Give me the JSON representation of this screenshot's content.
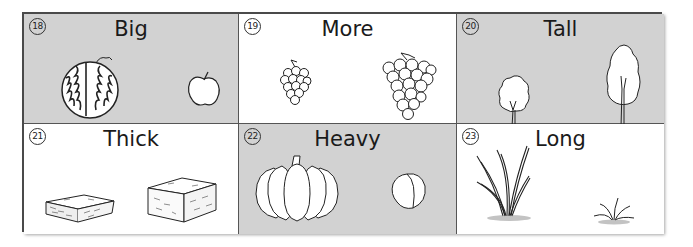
{
  "cards": [
    {
      "number": "18",
      "word": "Big",
      "background": "#d2d2d2",
      "illustrations": [
        "watermelon",
        "apple"
      ]
    },
    {
      "number": "19",
      "word": "More",
      "background": "#ffffff",
      "illustrations": [
        "small-grape-bunch",
        "large-grape-bunch"
      ]
    },
    {
      "number": "20",
      "word": "Tall",
      "background": "#d2d2d2",
      "illustrations": [
        "short-tree",
        "tall-tree"
      ]
    },
    {
      "number": "21",
      "word": "Thick",
      "background": "#ffffff",
      "illustrations": [
        "thin-hay-bale",
        "thick-hay-bale"
      ]
    },
    {
      "number": "22",
      "word": "Heavy",
      "background": "#d2d2d2",
      "illustrations": [
        "pumpkin",
        "peach"
      ]
    },
    {
      "number": "23",
      "word": "Long",
      "background": "#ffffff",
      "illustrations": [
        "long-grass",
        "short-grass"
      ]
    }
  ]
}
